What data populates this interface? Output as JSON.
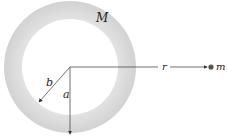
{
  "diagram": {
    "labels": {
      "shell_mass": "M",
      "outer_radius": "b",
      "inner_radius": "a",
      "distance": "r",
      "point_mass": "m"
    },
    "geometry": {
      "center": [
        70,
        67
      ],
      "outer_radius_px": 66,
      "inner_radius_px": 48,
      "point_mass_position": [
        212,
        67
      ]
    },
    "colors": {
      "shell_fill": "#d9d9d9",
      "inner_fill": "#ffffff",
      "line": "#333333",
      "point_mass": "#555555"
    }
  }
}
